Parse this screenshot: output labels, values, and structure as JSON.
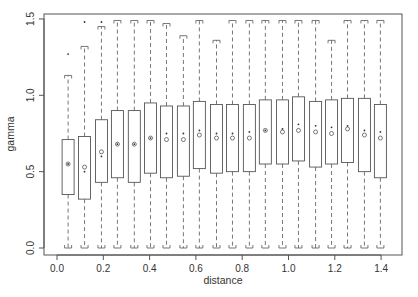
{
  "chart_data": {
    "type": "box",
    "title": "",
    "xlabel": "distance",
    "ylabel": "gamma",
    "xlim": [
      -0.05,
      1.5
    ],
    "ylim": [
      -0.04,
      1.54
    ],
    "xticks": [
      0.0,
      0.2,
      0.4,
      0.6,
      0.8,
      1.0,
      1.2,
      1.4
    ],
    "xtick_labels": [
      "0.0",
      "0.2",
      "0.4",
      "0.6",
      "0.8",
      "1.0",
      "1.2",
      "1.4"
    ],
    "yticks": [
      0.0,
      0.5,
      1.0,
      1.5
    ],
    "ytick_labels": [
      "0.0",
      "0.5",
      "1.0",
      "1.5"
    ],
    "grid": false,
    "legend": null,
    "boxes": [
      {
        "x": 0.048,
        "q1": 0.35,
        "q3": 0.71,
        "whisker_low": 0.0,
        "whisker_high": 1.13,
        "mean": 0.55,
        "median_dot": 0.55,
        "outliers": [
          1.27
        ]
      },
      {
        "x": 0.119,
        "q1": 0.32,
        "q3": 0.73,
        "whisker_low": 0.0,
        "whisker_high": 1.32,
        "mean": 0.53,
        "median_dot": 0.5,
        "outliers": [
          1.48
        ]
      },
      {
        "x": 0.192,
        "q1": 0.43,
        "q3": 0.84,
        "whisker_low": 0.0,
        "whisker_high": 1.45,
        "mean": 0.63,
        "median_dot": 0.6,
        "outliers": [
          1.48
        ]
      },
      {
        "x": 0.261,
        "q1": 0.46,
        "q3": 0.9,
        "whisker_low": 0.0,
        "whisker_high": 1.49,
        "mean": 0.68,
        "median_dot": 0.68,
        "outliers": []
      },
      {
        "x": 0.334,
        "q1": 0.43,
        "q3": 0.9,
        "whisker_low": 0.0,
        "whisker_high": 1.49,
        "mean": 0.68,
        "median_dot": 0.68,
        "outliers": []
      },
      {
        "x": 0.404,
        "q1": 0.49,
        "q3": 0.95,
        "whisker_low": 0.0,
        "whisker_high": 1.49,
        "mean": 0.72,
        "median_dot": 0.72,
        "outliers": []
      },
      {
        "x": 0.473,
        "q1": 0.46,
        "q3": 0.93,
        "whisker_low": 0.0,
        "whisker_high": 1.47,
        "mean": 0.71,
        "median_dot": 0.75,
        "outliers": []
      },
      {
        "x": 0.546,
        "q1": 0.47,
        "q3": 0.93,
        "whisker_low": 0.0,
        "whisker_high": 1.39,
        "mean": 0.71,
        "median_dot": 0.75,
        "outliers": []
      },
      {
        "x": 0.615,
        "q1": 0.52,
        "q3": 0.96,
        "whisker_low": 0.0,
        "whisker_high": 1.49,
        "mean": 0.74,
        "median_dot": 0.77,
        "outliers": []
      },
      {
        "x": 0.689,
        "q1": 0.49,
        "q3": 0.94,
        "whisker_low": 0.0,
        "whisker_high": 1.36,
        "mean": 0.72,
        "median_dot": 0.75,
        "outliers": []
      },
      {
        "x": 0.758,
        "q1": 0.5,
        "q3": 0.94,
        "whisker_low": 0.0,
        "whisker_high": 1.49,
        "mean": 0.72,
        "median_dot": 0.75,
        "outliers": []
      },
      {
        "x": 0.831,
        "q1": 0.5,
        "q3": 0.94,
        "whisker_low": 0.0,
        "whisker_high": 1.49,
        "mean": 0.72,
        "median_dot": 0.76,
        "outliers": []
      },
      {
        "x": 0.9,
        "q1": 0.55,
        "q3": 0.97,
        "whisker_low": 0.0,
        "whisker_high": 1.49,
        "mean": 0.77,
        "median_dot": 0.77,
        "outliers": []
      },
      {
        "x": 0.974,
        "q1": 0.55,
        "q3": 0.97,
        "whisker_low": 0.0,
        "whisker_high": 1.49,
        "mean": 0.76,
        "median_dot": 0.78,
        "outliers": []
      },
      {
        "x": 1.043,
        "q1": 0.57,
        "q3": 0.99,
        "whisker_low": 0.0,
        "whisker_high": 1.49,
        "mean": 0.77,
        "median_dot": 0.81,
        "outliers": []
      },
      {
        "x": 1.117,
        "q1": 0.53,
        "q3": 0.96,
        "whisker_low": 0.0,
        "whisker_high": 1.49,
        "mean": 0.76,
        "median_dot": 0.8,
        "outliers": []
      },
      {
        "x": 1.186,
        "q1": 0.55,
        "q3": 0.97,
        "whisker_low": 0.0,
        "whisker_high": 1.36,
        "mean": 0.75,
        "median_dot": 0.79,
        "outliers": []
      },
      {
        "x": 1.255,
        "q1": 0.56,
        "q3": 0.98,
        "whisker_low": 0.0,
        "whisker_high": 1.49,
        "mean": 0.78,
        "median_dot": 0.8,
        "outliers": []
      },
      {
        "x": 1.328,
        "q1": 0.5,
        "q3": 0.98,
        "whisker_low": 0.0,
        "whisker_high": 1.49,
        "mean": 0.74,
        "median_dot": 0.77,
        "outliers": []
      },
      {
        "x": 1.397,
        "q1": 0.46,
        "q3": 0.94,
        "whisker_low": 0.0,
        "whisker_high": 1.49,
        "mean": 0.72,
        "median_dot": 0.76,
        "outliers": []
      }
    ]
  }
}
